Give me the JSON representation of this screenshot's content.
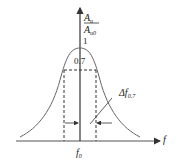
{
  "diagram": {
    "type": "resonance-curve",
    "y_axis": {
      "label_numerator": "A",
      "label_numerator_sub": "u",
      "label_denominator": "A",
      "label_denominator_sub": "u0"
    },
    "x_axis": {
      "label": "f"
    },
    "peak_label": "1",
    "level_label": "0.7",
    "center_label": "f",
    "center_label_sub": "0",
    "bandwidth_label": "Δf",
    "bandwidth_label_sub": "0.7"
  },
  "colors": {
    "line": "#555555",
    "text": "#222222"
  }
}
